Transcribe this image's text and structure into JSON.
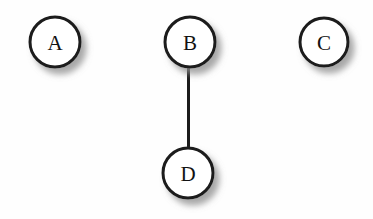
{
  "diagram": {
    "background_color": "#fefefe",
    "node_fill_color": "#ffffff",
    "node_stroke_color": "#1a1a1a",
    "edge_color": "#1a1a1a",
    "label_color": "#121212",
    "shadow_color": "#9a9a9a",
    "node_stroke_width": 3,
    "edge_stroke_width": 4.5,
    "nodes": [
      {
        "id": "A",
        "label": "A",
        "cx": 55,
        "cy": 42,
        "r": 25
      },
      {
        "id": "B",
        "label": "B",
        "cx": 190,
        "cy": 42,
        "r": 25
      },
      {
        "id": "C",
        "label": "C",
        "cx": 324,
        "cy": 42,
        "r": 24
      },
      {
        "id": "D",
        "label": "D",
        "cx": 188,
        "cy": 173,
        "r": 25
      }
    ],
    "edges": [
      {
        "id": "A-B",
        "from": "A",
        "to": "B",
        "x1": 80,
        "y1": 43,
        "x2": 165,
        "y2": 43
      },
      {
        "id": "B-C",
        "from": "B",
        "to": "C",
        "x1": 215,
        "y1": 43,
        "x2": 300,
        "y2": 43
      },
      {
        "id": "B-D",
        "from": "B",
        "to": "D",
        "x1": 189,
        "y1": 67,
        "x2": 188,
        "y2": 148
      }
    ]
  },
  "chart_data": {
    "type": "diagram",
    "subtype": "node-link-graph",
    "node_count": 4,
    "edge_count": 3,
    "directed": false,
    "nodes": [
      "A",
      "B",
      "C",
      "D"
    ],
    "edges": [
      [
        "A",
        "B"
      ],
      [
        "B",
        "C"
      ],
      [
        "B",
        "D"
      ]
    ],
    "degrees": {
      "A": 1,
      "B": 3,
      "C": 1,
      "D": 1
    }
  }
}
